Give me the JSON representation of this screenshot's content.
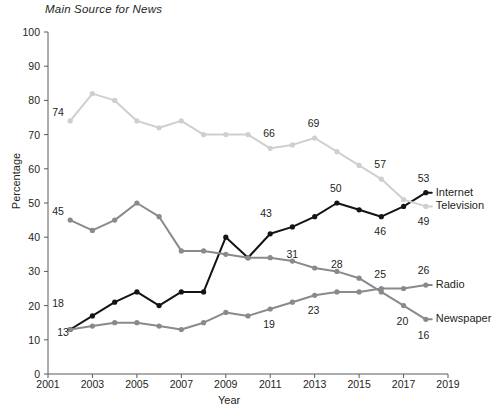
{
  "chart_data": {
    "type": "line",
    "title": "Main Source for News",
    "xlabel": "Year",
    "ylabel": "Percentage",
    "xlim": [
      2001,
      2019
    ],
    "ylim": [
      0,
      100
    ],
    "grid": false,
    "legend_position": "right-inline",
    "x_ticks": [
      "2001",
      "2003",
      "2005",
      "2007",
      "2009",
      "2011",
      "2013",
      "2015",
      "2017",
      "2019"
    ],
    "y_ticks": [
      "0",
      "10",
      "20",
      "30",
      "40",
      "50",
      "60",
      "70",
      "80",
      "90",
      "100"
    ],
    "x": [
      2002,
      2003,
      2004,
      2005,
      2006,
      2007,
      2008,
      2009,
      2010,
      2011,
      2012,
      2013,
      2014,
      2015,
      2016,
      2017,
      2018
    ],
    "series": [
      {
        "name": "Internet",
        "color": "#141414",
        "values": [
          13,
          17,
          21,
          24,
          20,
          24,
          24,
          40,
          34,
          41,
          43,
          46,
          50,
          48,
          46,
          49,
          53
        ],
        "point_labels": [
          {
            "x": 2002,
            "value": 13,
            "text": "13",
            "dx": -13,
            "dy": 2
          },
          {
            "x": 2011,
            "value": 43,
            "text": "43",
            "dx": -10,
            "dy": -14
          },
          {
            "x": 2014,
            "value": 50,
            "text": "50",
            "dx": -7,
            "dy": -15
          },
          {
            "x": 2016,
            "value": 46,
            "text": "46",
            "dx": -7,
            "dy": 14
          },
          {
            "x": 2018,
            "value": 53,
            "text": "53",
            "dx": -8,
            "dy": -15
          }
        ]
      },
      {
        "name": "Television",
        "color": "#cfcfcf",
        "values": [
          74,
          82,
          80,
          74,
          72,
          74,
          70,
          70,
          70,
          66,
          67,
          69,
          65,
          61,
          57,
          51,
          49
        ],
        "point_labels": [
          {
            "x": 2002,
            "value": 74,
            "text": "74",
            "dx": -18,
            "dy": -9
          },
          {
            "x": 2011,
            "value": 66,
            "text": "66",
            "dx": -7,
            "dy": -15
          },
          {
            "x": 2013,
            "value": 69,
            "text": "69",
            "dx": -7,
            "dy": -15
          },
          {
            "x": 2016,
            "value": 57,
            "text": "57",
            "dx": -7,
            "dy": -15
          },
          {
            "x": 2018,
            "value": 49,
            "text": "49",
            "dx": -8,
            "dy": 15
          }
        ]
      },
      {
        "name": "Radio",
        "color": "#8a8a8a",
        "values": [
          13,
          14,
          15,
          15,
          14,
          13,
          15,
          18,
          17,
          19,
          21,
          23,
          24,
          24,
          25,
          25,
          26
        ],
        "point_labels": [
          {
            "x": 2011,
            "value": 19,
            "text": "19",
            "dx": -7,
            "dy": 15
          },
          {
            "x": 2013,
            "value": 23,
            "text": "23",
            "dx": -7,
            "dy": 15
          },
          {
            "x": 2016,
            "value": 25,
            "text": "25",
            "dx": -7,
            "dy": -15
          },
          {
            "x": 2018,
            "value": 26,
            "text": "26",
            "dx": -8,
            "dy": -15
          }
        ]
      },
      {
        "name": "Newspaper",
        "color": "#8a8a8a",
        "values": [
          45,
          42,
          45,
          50,
          46,
          36,
          36,
          35,
          34,
          34,
          33,
          31,
          30,
          28,
          24,
          20,
          16
        ],
        "point_labels": [
          {
            "x": 2002,
            "value": 45,
            "text": "45",
            "dx": -18,
            "dy": -9
          },
          {
            "x": 2002,
            "value": 18,
            "text": "18",
            "dx": -18,
            "dy": -9,
            "note": "radio-start"
          },
          {
            "x": 2012,
            "value": 31,
            "text": "31",
            "dx": -6,
            "dy": -14
          },
          {
            "x": 2014,
            "value": 28,
            "text": "28",
            "dx": -6,
            "dy": -14
          },
          {
            "x": 2017,
            "value": 20,
            "text": "20",
            "dx": -7,
            "dy": 15
          },
          {
            "x": 2018,
            "value": 16,
            "text": "16",
            "dx": -8,
            "dy": 16
          }
        ]
      }
    ],
    "series_labels": [
      {
        "name": "Internet",
        "value": 53
      },
      {
        "name": "Television",
        "value": 49
      },
      {
        "name": "Radio",
        "value": 26
      },
      {
        "name": "Newspaper",
        "value": 16
      }
    ]
  }
}
